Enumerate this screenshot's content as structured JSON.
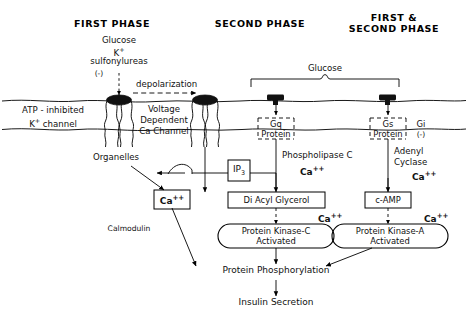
{
  "figure": {
    "type": "biological-pathway-diagram",
    "background": "#ffffff",
    "ink": "#000000"
  },
  "headers": [
    {
      "id": "first-phase",
      "text": "FIRST PHASE"
    },
    {
      "id": "second-phase",
      "text": "SECOND PHASE"
    },
    {
      "id": "first-second-phase",
      "line1": "FIRST &",
      "line2": "SECOND PHASE"
    }
  ],
  "stimuli": {
    "left_stack": [
      "Glucose",
      "K",
      "sulfonylureas"
    ],
    "k_superscript": "+",
    "inhibition_sign": "(-)",
    "depolarization": "depolarization"
  },
  "membrane": {
    "channels": [
      {
        "id": "katp-channel",
        "line1": "ATP - inhibited",
        "line2": "K",
        "line2_sup": "+",
        "line3": "channel"
      },
      {
        "id": "vdcc",
        "line1": "Voltage",
        "line2": "Dependent",
        "line3": "Ca Channel"
      }
    ],
    "receptors": [
      {
        "id": "gq-receptor",
        "g_protein_label": "Gq",
        "protein_word": "Protein"
      },
      {
        "id": "gs-receptor",
        "g_protein_label": "Gs",
        "protein_word": "Protein"
      }
    ],
    "gi": {
      "label": "Gi",
      "sign": "(-)"
    },
    "glucose_bracket_label": "Glucose"
  },
  "cytosol": {
    "organelles_label": "Organelles",
    "calmodulin_label": "Calmodulin",
    "enzymes": [
      {
        "id": "phospholipase-c",
        "line1": "Phospholipase C",
        "ion": "Ca",
        "ion_sup": "++"
      },
      {
        "id": "adenyl-cyclase",
        "line1": "Adenyl",
        "line2": "Cyclase",
        "ion": "Ca",
        "ion_sup": "++"
      }
    ],
    "boxes": [
      {
        "id": "ip3-box",
        "text": "IP",
        "sub": "3"
      },
      {
        "id": "ca-box",
        "text": "Ca",
        "sup": "++"
      },
      {
        "id": "dag-box",
        "text": "Di Acyl Glycerol"
      },
      {
        "id": "camp-box",
        "text": "c-AMP"
      }
    ],
    "kinases": [
      {
        "id": "pkc",
        "line1": "Protein Kinase-C",
        "line2": "Activated",
        "ion": "Ca",
        "ion_sup": "++"
      },
      {
        "id": "pka",
        "line1": "Protein Kinase-A",
        "line2": "Activated",
        "ion": "Ca",
        "ion_sup": "++"
      }
    ],
    "outputs": [
      {
        "id": "protein-phosphorylation",
        "text": "Protein  Phosphorylation"
      },
      {
        "id": "insulin-secretion",
        "text": "Insulin  Secretion"
      }
    ]
  }
}
